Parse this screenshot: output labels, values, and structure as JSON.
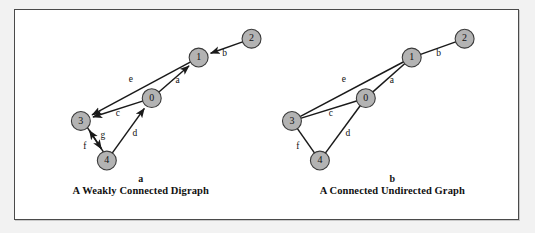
{
  "figure": {
    "background_color": "#ffffff",
    "outer_color": "#f2f2f2",
    "frame_color": "#4a4a4a",
    "node_fill": "#b3b3b3",
    "node_stroke": "#3a3a3a",
    "edge_color": "#1a1a1a",
    "label_color": "#111111",
    "node_radius": 9.5
  },
  "panels": [
    {
      "id": "a",
      "caption_letter": "a",
      "caption_title": "A Weakly Connected Digraph",
      "directed": true,
      "nodes": [
        {
          "id": "0",
          "label": "0",
          "x": 137,
          "y": 89
        },
        {
          "id": "1",
          "label": "1",
          "x": 184,
          "y": 48
        },
        {
          "id": "2",
          "label": "2",
          "x": 237,
          "y": 29
        },
        {
          "id": "3",
          "label": "3",
          "x": 66,
          "y": 112
        },
        {
          "id": "4",
          "label": "4",
          "x": 92,
          "y": 152
        }
      ],
      "edges": [
        {
          "label": "a",
          "from": "0",
          "to": "1",
          "label_x": 163,
          "label_y": 72
        },
        {
          "label": "b",
          "from": "2",
          "to": "1",
          "label_x": 210,
          "label_y": 44
        },
        {
          "label": "c",
          "from": "0",
          "to": "3",
          "label_x": 103,
          "label_y": 105
        },
        {
          "label": "d",
          "from": "4",
          "to": "0",
          "label_x": 120,
          "label_y": 125
        },
        {
          "label": "e",
          "from": "1",
          "to": "3",
          "label_x": 116,
          "label_y": 71
        },
        {
          "label": "f",
          "from": "3",
          "to": "4",
          "label_x": 70,
          "label_y": 138
        },
        {
          "label": "g",
          "from": "4",
          "to": "3",
          "label_x": 88,
          "label_y": 127
        }
      ]
    },
    {
      "id": "b",
      "caption_letter": "b",
      "caption_title": "A Connected Undirected Graph",
      "directed": false,
      "nodes": [
        {
          "id": "0",
          "label": "0",
          "x": 99,
          "y": 89
        },
        {
          "id": "1",
          "label": "1",
          "x": 145,
          "y": 48
        },
        {
          "id": "2",
          "label": "2",
          "x": 198,
          "y": 29
        },
        {
          "id": "3",
          "label": "3",
          "x": 25,
          "y": 112
        },
        {
          "id": "4",
          "label": "4",
          "x": 53,
          "y": 152
        }
      ],
      "edges": [
        {
          "label": "a",
          "from": "0",
          "to": "1",
          "label_x": 125,
          "label_y": 72
        },
        {
          "label": "b",
          "from": "2",
          "to": "1",
          "label_x": 172,
          "label_y": 44
        },
        {
          "label": "c",
          "from": "0",
          "to": "3",
          "label_x": 64,
          "label_y": 105
        },
        {
          "label": "d",
          "from": "4",
          "to": "0",
          "label_x": 81,
          "label_y": 125
        },
        {
          "label": "e",
          "from": "1",
          "to": "3",
          "label_x": 77,
          "label_y": 71
        },
        {
          "label": "f",
          "from": "3",
          "to": "4",
          "label_x": 31,
          "label_y": 138
        }
      ]
    }
  ]
}
